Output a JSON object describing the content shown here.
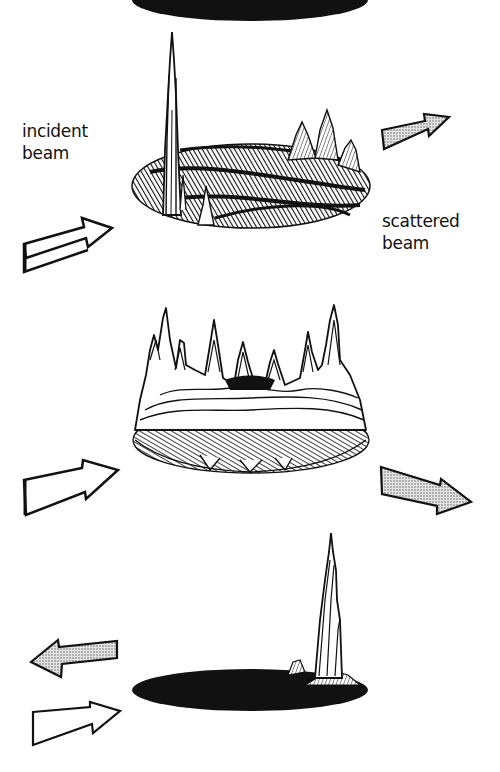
{
  "figure": {
    "panels": [
      {
        "id": "top",
        "description": "incident beam on surface with single sharp specular peak at left and small peaks at right rim, dense hatched surface",
        "labels": {
          "incident": [
            "incident",
            "beam"
          ],
          "scattered": [
            "scattered",
            "beam"
          ]
        },
        "arrows": [
          {
            "name": "incident-beam-arrow",
            "style": "outline",
            "direction": "right-up"
          },
          {
            "name": "scattered-beam-arrow",
            "style": "stippled",
            "direction": "right-up"
          }
        ]
      },
      {
        "id": "middle",
        "description": "ring of many peaks around elliptical base (diffuse scattering)",
        "arrows": [
          {
            "name": "incident-beam-arrow",
            "style": "outline",
            "direction": "right-up"
          },
          {
            "name": "scattered-beam-arrow",
            "style": "stippled",
            "direction": "right-down"
          }
        ]
      },
      {
        "id": "bottom",
        "description": "black elliptical base with single tall peak at right (backscatter)",
        "arrows": [
          {
            "name": "backscattered-beam-arrow",
            "style": "stippled",
            "direction": "left"
          },
          {
            "name": "incident-beam-arrow",
            "style": "outline",
            "direction": "right-up"
          }
        ]
      }
    ],
    "colors": {
      "ink": "#111111",
      "stipple": "#c8c8c8",
      "background": "#ffffff"
    }
  }
}
